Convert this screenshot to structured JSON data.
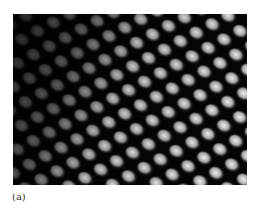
{
  "figure": {
    "caption_label": "(a)"
  }
}
